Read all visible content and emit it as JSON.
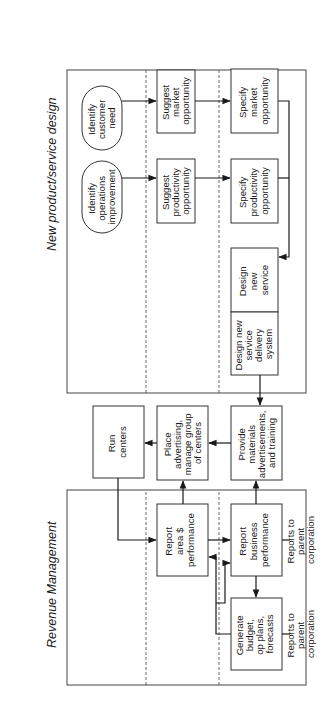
{
  "diagram": {
    "orientation": "rotated 90 degrees counter-clockwise",
    "swimlanes": [
      {
        "title": "New product/service design"
      },
      {
        "title": "Revenue Management"
      }
    ],
    "nodes": {
      "identify_customer_need": {
        "label": [
          "Identify",
          "customer",
          "need"
        ],
        "shape": "rounded"
      },
      "identify_operations_improvement": {
        "label": [
          "Identify",
          "operations",
          "improvement"
        ],
        "shape": "rounded"
      },
      "suggest_market_opportunity": {
        "label": [
          "Suggest",
          "market",
          "opportunity"
        ]
      },
      "suggest_productivity_opportunity": {
        "label": [
          "Suggest",
          "productivity",
          "opportunity"
        ]
      },
      "specify_market_opportunity": {
        "label": [
          "Specify",
          "market",
          "opportunity"
        ]
      },
      "specify_productivity_opportunity": {
        "label": [
          "Specify",
          "productivity",
          "opportunity"
        ]
      },
      "design_new_service": {
        "label": [
          "Design",
          "new",
          "service"
        ]
      },
      "design_new_service_delivery_system": {
        "label": [
          "Design new",
          "service",
          "delivery",
          "system"
        ]
      },
      "run_centers": {
        "label": [
          "Run",
          "centers"
        ]
      },
      "place_advertising": {
        "label": [
          "Place",
          "advertising,",
          "manage group",
          "of centers"
        ]
      },
      "provide_materials": {
        "label": [
          "Provide",
          "materials",
          "advertisements,",
          "and training"
        ]
      },
      "report_area_performance": {
        "label": [
          "Report",
          "area $",
          "performance"
        ]
      },
      "report_business_performance": {
        "label": [
          "Report",
          "business",
          "performance"
        ]
      },
      "generate_budget": {
        "label": [
          "Generate",
          "budget,",
          "op plans,",
          "forecasts"
        ]
      },
      "reports_to_parent_1": {
        "label": [
          "Reports to",
          "parent",
          "corporation"
        ],
        "shape": "text"
      },
      "reports_to_parent_2": {
        "label": [
          "Reports to",
          "parent",
          "corporation"
        ],
        "shape": "text"
      }
    },
    "edges": [
      [
        "identify_customer_need",
        "suggest_market_opportunity"
      ],
      [
        "identify_operations_improvement",
        "suggest_productivity_opportunity"
      ],
      [
        "suggest_market_opportunity",
        "specify_market_opportunity"
      ],
      [
        "suggest_productivity_opportunity",
        "specify_productivity_opportunity"
      ],
      [
        "specify_market_opportunity",
        "design_new_service"
      ],
      [
        "specify_productivity_opportunity",
        "design_new_service"
      ],
      [
        "design_new_service_delivery_system",
        "provide_materials"
      ],
      [
        "provide_materials",
        "place_advertising"
      ],
      [
        "place_advertising",
        "run_centers"
      ],
      [
        "run_centers",
        "report_area_performance"
      ],
      [
        "report_area_performance",
        "place_advertising"
      ],
      [
        "report_area_performance",
        "report_business_performance"
      ],
      [
        "report_business_performance",
        "provide_materials"
      ],
      [
        "report_business_performance",
        "generate_budget"
      ],
      [
        "generate_budget",
        "report_area_performance"
      ],
      [
        "generate_budget",
        "report_business_performance"
      ],
      [
        "report_business_performance",
        "reports_to_parent_1"
      ],
      [
        "generate_budget",
        "reports_to_parent_2"
      ]
    ]
  }
}
